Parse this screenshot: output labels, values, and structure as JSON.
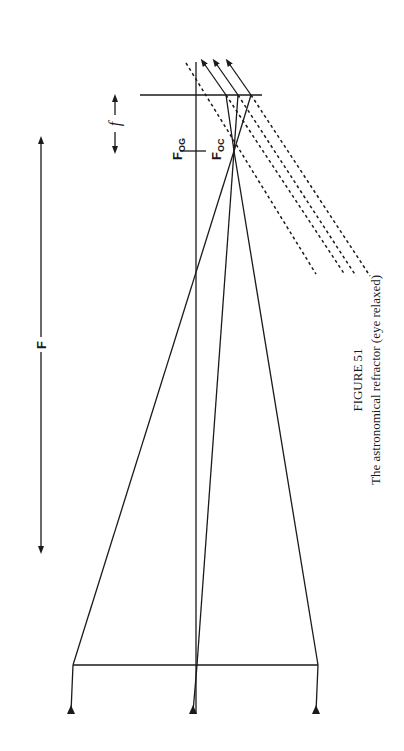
{
  "figure": {
    "number_label": "FIGURE 51",
    "caption": "The astronomical refractor (eye relaxed)",
    "orientation": "rotated 90° counter-clockwise"
  },
  "labels": {
    "objective_focal_length": "F",
    "eyepiece_focal_length": "f",
    "focus_objective": {
      "main": "F",
      "sub": "OG"
    },
    "focus_eyepiece": {
      "main": "F",
      "sub": "OC"
    }
  },
  "colors": {
    "ink": "#1a1a1a",
    "paper": "#ffffff"
  }
}
